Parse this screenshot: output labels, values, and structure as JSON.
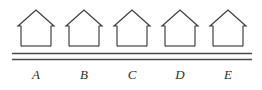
{
  "figure": {
    "background_color": "#ffffff",
    "stroke_color": "#3a3a3a",
    "road_color": "#4a4a4a",
    "label_color": "#2e2e2e"
  },
  "road": {
    "name": "road",
    "line_count": 2,
    "x_start": 12,
    "x_end": 252,
    "lines": [
      {
        "y": 53.5
      },
      {
        "y": 59.5
      }
    ]
  },
  "houses": [
    {
      "label": "A",
      "center_x": 36,
      "wall_left": 21,
      "wall_right": 51,
      "wall_top": 25,
      "wall_bottom": 46,
      "eave_left": 18,
      "eave_right": 54,
      "eave_y": 26,
      "apex_x": 36,
      "apex_y": 10,
      "label_x": 36,
      "label_y": 79
    },
    {
      "label": "B",
      "center_x": 84,
      "wall_left": 69,
      "wall_right": 99,
      "wall_top": 25,
      "wall_bottom": 46,
      "eave_left": 66,
      "eave_right": 102,
      "eave_y": 26,
      "apex_x": 84,
      "apex_y": 10,
      "label_x": 84,
      "label_y": 79
    },
    {
      "label": "C",
      "center_x": 132,
      "wall_left": 117,
      "wall_right": 147,
      "wall_top": 25,
      "wall_bottom": 46,
      "eave_left": 114,
      "eave_right": 150,
      "eave_y": 26,
      "apex_x": 132,
      "apex_y": 10,
      "label_x": 132,
      "label_y": 79
    },
    {
      "label": "D",
      "center_x": 180,
      "wall_left": 165,
      "wall_right": 195,
      "wall_top": 25,
      "wall_bottom": 46,
      "eave_left": 162,
      "eave_right": 198,
      "eave_y": 26,
      "apex_x": 180,
      "apex_y": 10,
      "label_x": 180,
      "label_y": 79
    },
    {
      "label": "E",
      "center_x": 228,
      "wall_left": 213,
      "wall_right": 243,
      "wall_top": 25,
      "wall_bottom": 46,
      "eave_left": 210,
      "eave_right": 246,
      "eave_y": 26,
      "apex_x": 228,
      "apex_y": 10,
      "label_x": 228,
      "label_y": 79
    }
  ]
}
